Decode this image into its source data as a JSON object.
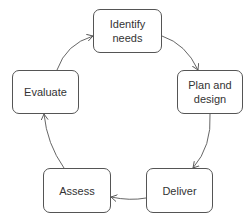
{
  "diagram": {
    "type": "cycle",
    "nodes": [
      {
        "id": "identify",
        "label": "Identify needs"
      },
      {
        "id": "plan",
        "label": "Plan and design"
      },
      {
        "id": "deliver",
        "label": "Deliver"
      },
      {
        "id": "assess",
        "label": "Assess"
      },
      {
        "id": "evaluate",
        "label": "Evaluate"
      }
    ],
    "edges": [
      {
        "from": "identify",
        "to": "plan"
      },
      {
        "from": "plan",
        "to": "deliver"
      },
      {
        "from": "deliver",
        "to": "assess"
      },
      {
        "from": "assess",
        "to": "evaluate"
      },
      {
        "from": "evaluate",
        "to": "identify"
      }
    ]
  },
  "colors": {
    "stroke": "#555555",
    "text": "#333333",
    "background": "#ffffff"
  }
}
